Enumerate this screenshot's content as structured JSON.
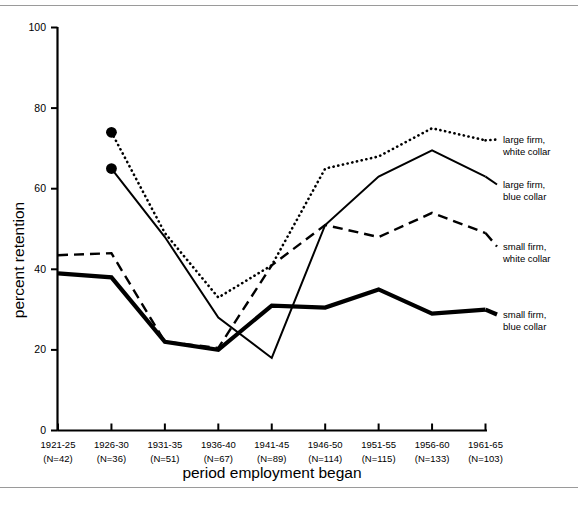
{
  "figure": {
    "background": "#ffffff",
    "rule_color": "#9a9a9a",
    "axis_color": "#000000"
  },
  "axes": {
    "y_title": "percent retention",
    "x_title": "period employment began",
    "y_ticks": [
      "0",
      "20",
      "40",
      "60",
      "80",
      "100"
    ],
    "y_tick_values": [
      0,
      20,
      40,
      60,
      80,
      100
    ],
    "x_tick_periods": [
      "1921-25",
      "1926-30",
      "1931-35",
      "1936-40",
      "1941-45",
      "1946-50",
      "1951-55",
      "1956-60",
      "1961-65"
    ],
    "x_tick_counts": [
      "(N=42)",
      "(N=36)",
      "(N=51)",
      "(N=67)",
      "(N=89)",
      "(N=114)",
      "(N=115)",
      "(N=133)",
      "(N=103)"
    ]
  },
  "legend": {
    "items": [
      {
        "line1": "large firm,",
        "line2": "white collar",
        "style": "dotted"
      },
      {
        "line1": "large firm,",
        "line2": "blue collar",
        "style": "solid-thin"
      },
      {
        "line1": "small firm,",
        "line2": "white collar",
        "style": "dashed"
      },
      {
        "line1": "small firm,",
        "line2": "blue collar",
        "style": "solid-thick"
      }
    ]
  },
  "chart_data": {
    "type": "line",
    "title": "",
    "xlabel": "period employment began",
    "ylabel": "percent retention",
    "ylim": [
      0,
      100
    ],
    "grid": false,
    "legend_position": "right",
    "categories": [
      "1921-25",
      "1926-30",
      "1931-35",
      "1936-40",
      "1941-45",
      "1946-50",
      "1951-55",
      "1956-60",
      "1961-65"
    ],
    "sample_sizes": [
      42,
      36,
      51,
      67,
      89,
      114,
      115,
      133,
      103
    ],
    "series": [
      {
        "name": "large firm, white collar",
        "style": "dotted",
        "marker_start": true,
        "values": [
          null,
          74,
          49,
          33,
          41,
          65,
          68,
          75,
          72
        ]
      },
      {
        "name": "large firm, blue collar",
        "style": "solid-thin",
        "marker_start": true,
        "values": [
          null,
          65,
          48,
          28,
          18,
          51,
          63,
          69.5,
          63
        ]
      },
      {
        "name": "small firm, white collar",
        "style": "dashed",
        "marker_start": false,
        "values": [
          43.5,
          44,
          22,
          20.5,
          41,
          51,
          48,
          54,
          49
        ]
      },
      {
        "name": "small firm, blue collar",
        "style": "solid-thick",
        "marker_start": false,
        "values": [
          39,
          38,
          22,
          20,
          31,
          30.5,
          35,
          29,
          30
        ]
      }
    ]
  }
}
